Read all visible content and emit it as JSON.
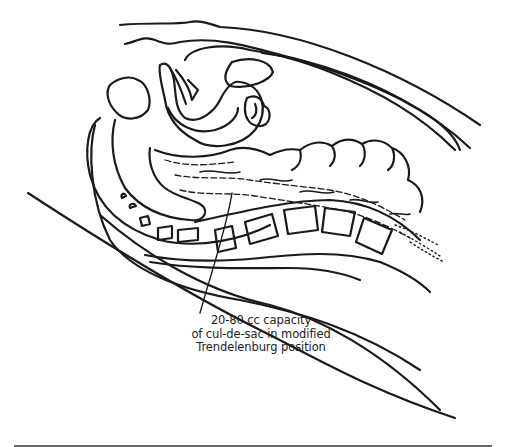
{
  "figure": {
    "caption_lines": [
      "20-80 cc capacity",
      "of cul-de-sac in modified",
      "Trendelenburg position"
    ],
    "colors": {
      "line": "#1a1a1a",
      "background": "#ffffff",
      "rule": "#666666"
    }
  }
}
